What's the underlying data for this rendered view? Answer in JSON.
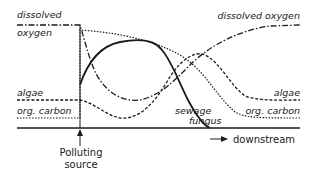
{
  "diagram": {
    "labels": {
      "left_dissolved": "dissolved",
      "left_oxygen": "oxygen",
      "left_algae": "algae",
      "left_org_carbon": "org. carbon",
      "right_dissolved_oxygen": "dissolved oxygen",
      "right_algae": "algae",
      "right_org_carbon": "org. carbon",
      "sewage": "sewage",
      "fungus": "fungus",
      "polluting": "Polluting",
      "source": "source",
      "downstream": "downstream"
    },
    "legend": [
      {
        "series": "dissolved oxygen",
        "line_style": "dash-dot"
      },
      {
        "series": "algae",
        "line_style": "dashed"
      },
      {
        "series": "org. carbon",
        "line_style": "dotted"
      },
      {
        "series": "sewage fungus",
        "line_style": "solid"
      }
    ],
    "colors": {
      "ink": "#1a1a1a",
      "background": "#ffffff"
    }
  }
}
